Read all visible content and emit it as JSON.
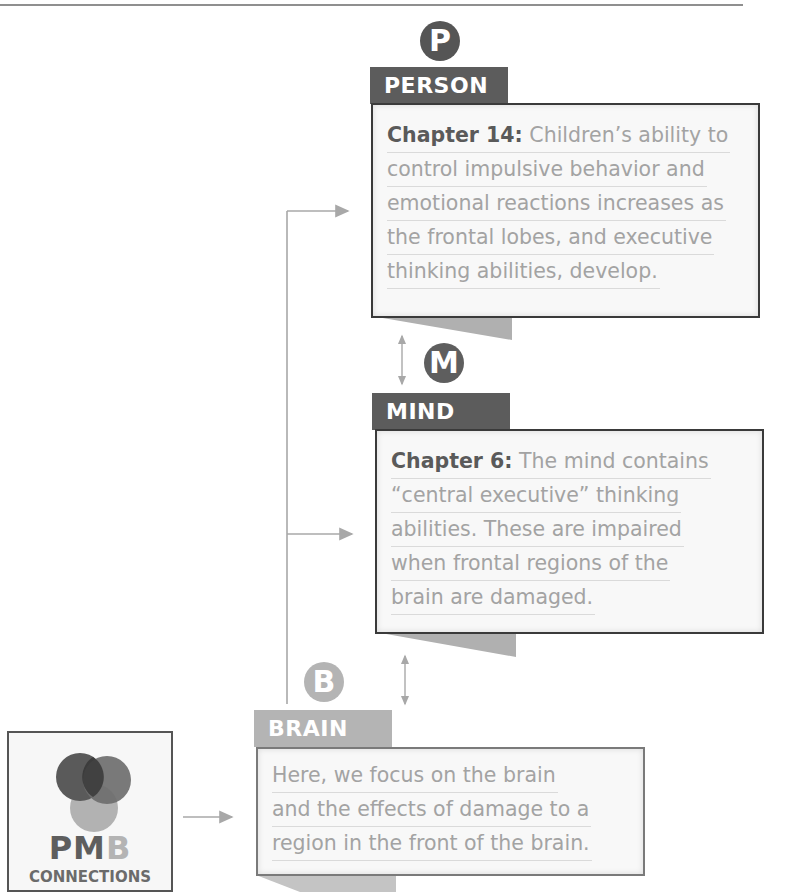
{
  "colors": {
    "dark": "#5a5a5a",
    "medium": "#6a6a6a",
    "light": "#b4b4b4",
    "body_text": "#a3a3a3",
    "connector": "#a8a8a8"
  },
  "person": {
    "badge_letter": "P",
    "label": "PERSON",
    "lines": [
      {
        "lead": "Chapter 14:",
        "text": " Children’s ability to"
      },
      {
        "text": "control impulsive behavior and"
      },
      {
        "text": "emotional reactions increases as"
      },
      {
        "text": "the frontal lobes, and executive"
      },
      {
        "text": "thinking abilities, develop."
      }
    ]
  },
  "mind": {
    "badge_letter": "M",
    "label": "MIND",
    "lines": [
      {
        "lead": "Chapter 6:",
        "text": " The mind contains"
      },
      {
        "text": "“central executive” thinking"
      },
      {
        "text": "abilities. These are impaired"
      },
      {
        "text": "when frontal regions of the"
      },
      {
        "text": "brain are damaged."
      }
    ]
  },
  "brain": {
    "badge_letter": "B",
    "label": "BRAIN",
    "lines": [
      {
        "lead": "Here,",
        "text": " we focus on the brain"
      },
      {
        "text": "and the effects of damage to a"
      },
      {
        "text": "region in the front of the brain."
      }
    ]
  },
  "logo": {
    "pm": "PM",
    "b": "B",
    "subtitle": "CONNECTIONS"
  }
}
